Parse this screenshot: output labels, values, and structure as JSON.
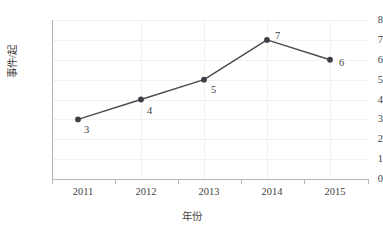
{
  "chart_data": {
    "type": "line",
    "title": "",
    "xlabel": "年份",
    "ylabel": "事件/起",
    "categories": [
      "2011",
      "2012",
      "2013",
      "2014",
      "2015"
    ],
    "values": [
      3,
      4,
      5,
      7,
      6
    ],
    "series": [
      {
        "name": "事件数",
        "values": [
          3,
          4,
          5,
          7,
          6
        ]
      }
    ],
    "point_labels": [
      "3",
      "4",
      "5",
      "7",
      "6"
    ],
    "ylim": [
      0,
      8
    ],
    "yticks": [
      "0",
      "1",
      "2",
      "3",
      "4",
      "5",
      "6",
      "7",
      "8"
    ],
    "xticks": [
      "2011",
      "2012",
      "2013",
      "2014",
      "2015"
    ],
    "grid": "horizontal-and-vertical",
    "legend": "none",
    "colors": {
      "line": "#4a4a52",
      "marker": "#3f3f47",
      "grid": "#f2f2f2",
      "axis": "#b6b6b6",
      "text": "#3f3f3f",
      "background": "#ffffff"
    }
  }
}
